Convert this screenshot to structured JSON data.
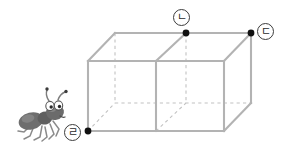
{
  "figure": {
    "background_color": "#ffffff"
  },
  "colors": {
    "solid_edge": "#b3b3b3",
    "hidden_edge": "#c2c2c2",
    "vertex_dot": "#111111",
    "label_outline": "#3c3c3c",
    "label_text": "#2b2b2b",
    "ant_body": "#6e6e6e",
    "ant_body_dark": "#5a5a5a",
    "ant_leg": "#8a8a8a",
    "ant_eye_white": "#ffffff",
    "ant_eye_pupil": "#2b2b2b"
  },
  "labels": [
    {
      "id": "a",
      "text": "ㄹ",
      "glyph_name": "circled-hangul-giyeok",
      "vertex": "front-bottom-left",
      "x": 88,
      "y": 131
    },
    {
      "id": "b",
      "text": "ㄴ",
      "glyph_name": "circled-hangul-nieun",
      "vertex": "back-top-middle",
      "x": 186,
      "y": 33
    },
    {
      "id": "c",
      "text": "ㄷ",
      "glyph_name": "circled-hangul-digeut",
      "vertex": "back-top-right",
      "x": 251,
      "y": 33
    }
  ],
  "box": {
    "shape": "rectangular-prism",
    "cube_count": 2,
    "dimensions": "2 x 1 x 1",
    "front_face": {
      "left": 88,
      "right": 224,
      "top": 61,
      "bottom": 131
    },
    "depth_offset": {
      "dx": 27,
      "dy": -28
    },
    "divider_x": 156,
    "vertices": {
      "front_top_left": [
        88,
        61
      ],
      "front_top_mid": [
        156,
        61
      ],
      "front_top_right": [
        224,
        61
      ],
      "front_bottom_left": [
        88,
        131
      ],
      "front_bottom_mid": [
        156,
        131
      ],
      "front_bottom_right": [
        224,
        131
      ],
      "back_top_left": [
        115,
        33
      ],
      "back_top_mid": [
        186,
        33
      ],
      "back_top_right": [
        251,
        33
      ],
      "back_bottom_left": [
        115,
        103
      ],
      "back_bottom_mid": [
        186,
        103
      ],
      "back_bottom_right": [
        251,
        103
      ]
    },
    "marked_vertices": [
      "front_bottom_left",
      "back_top_mid",
      "back_top_right"
    ]
  },
  "ant": {
    "name": "ant-illustration",
    "facing": "right",
    "position": {
      "x": 14,
      "y": 98,
      "width": 52,
      "height": 46
    },
    "parts": [
      "head",
      "thorax",
      "abdomen",
      "two-antennae",
      "six-legs",
      "two-eyes"
    ]
  }
}
